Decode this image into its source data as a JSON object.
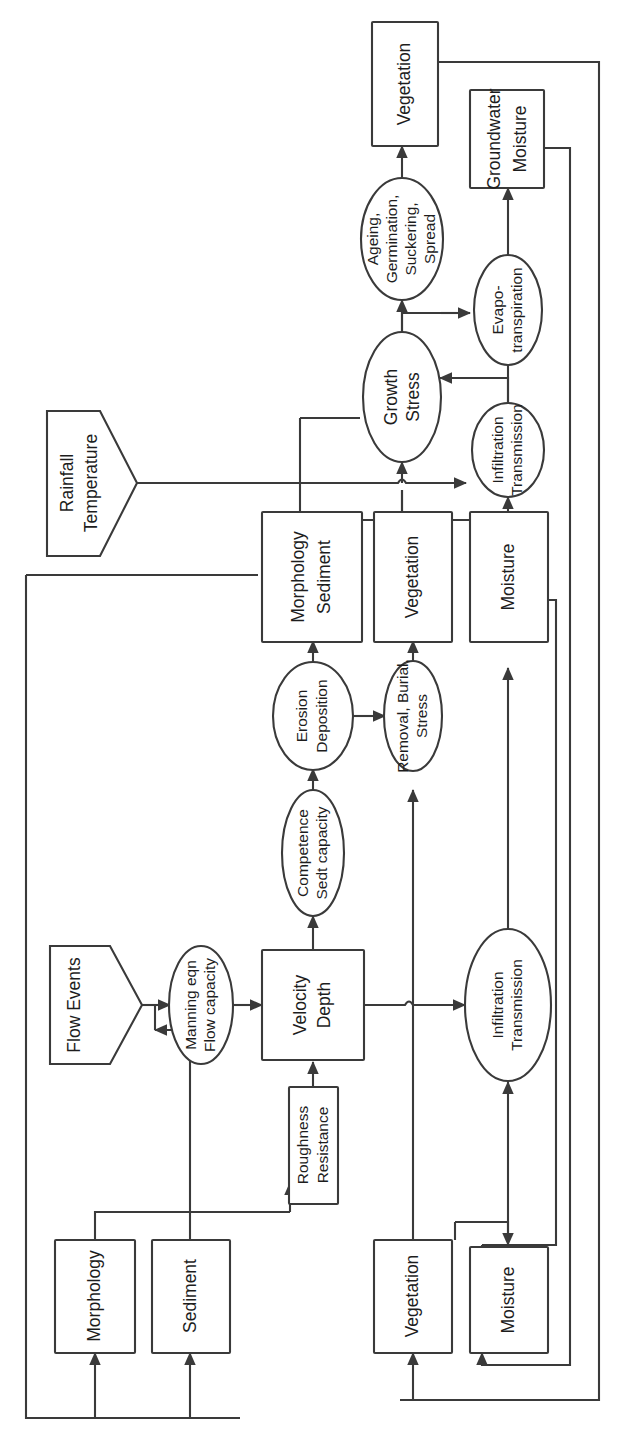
{
  "diagram": {
    "orientation": "rotated-90-ccw",
    "nodes": {
      "morphology_state": {
        "label": "Morphology",
        "shape": "box"
      },
      "sediment_state": {
        "label": "Sediment",
        "shape": "box"
      },
      "vegetation_state": {
        "label": "Vegetation",
        "shape": "box"
      },
      "moisture_state": {
        "label": "Moisture",
        "shape": "box"
      },
      "flow_events": {
        "label": "Flow Events",
        "shape": "trapezoid"
      },
      "rainfall_temperature": {
        "label_line1": "Rainfall",
        "label_line2": "Temperature",
        "shape": "trapezoid"
      },
      "manning": {
        "label_line1": "Manning eqn",
        "label_line2": "Flow capacity",
        "shape": "ellipse"
      },
      "roughness": {
        "label_line1": "Roughness",
        "label_line2": "Resistance",
        "shape": "box"
      },
      "velocity_depth": {
        "label_line1": "Velocity",
        "label_line2": "Depth",
        "shape": "box"
      },
      "competence": {
        "label_line1": "Competence",
        "label_line2": "Sedt capacity",
        "shape": "ellipse"
      },
      "erosion": {
        "label_line1": "Erosion",
        "label_line2": "Deposition",
        "shape": "ellipse"
      },
      "removal": {
        "label_line1": "Removal, Burial,",
        "label_line2": "Stress",
        "shape": "ellipse"
      },
      "infiltration_lower": {
        "label_line1": "Infiltration",
        "label_line2": "Transmission",
        "shape": "ellipse"
      },
      "morph_sed_out": {
        "label_line1": "Morphology",
        "label_line2": "Sediment",
        "shape": "box"
      },
      "vegetation_out": {
        "label": "Vegetation",
        "shape": "box"
      },
      "moisture_out": {
        "label": "Moisture",
        "shape": "box"
      },
      "infiltration_upper": {
        "label_line1": "Infiltration",
        "label_line2": "Transmission",
        "shape": "ellipse"
      },
      "growth_stress": {
        "label_line1": "Growth",
        "label_line2": "Stress",
        "shape": "ellipse"
      },
      "evapotranspiration": {
        "label_line1": "Evapo-",
        "label_line2": "transpiration",
        "shape": "ellipse"
      },
      "ageing": {
        "label_line1": "Ageing,",
        "label_line2": "Germination,",
        "label_line3": "Suckering,",
        "label_line4": "Spread",
        "shape": "ellipse"
      },
      "vegetation_final": {
        "label": "Vegetation",
        "shape": "box"
      },
      "groundwater_moisture": {
        "label_line1": "Groundwater",
        "label_line2": "Moisture",
        "shape": "box"
      }
    },
    "colors": {
      "stroke": "#3a3a3a",
      "fill": "#ffffff",
      "text": "#1d1d1d",
      "background": "#ffffff"
    }
  }
}
